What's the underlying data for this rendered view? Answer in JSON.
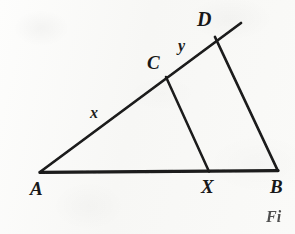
{
  "figure": {
    "caption_fragment": "Fi",
    "background_color": "#fbfbfa",
    "ink_color": "#1a1a1a",
    "vertices": [
      {
        "id": "A",
        "label": "A",
        "x": 40,
        "y": 172,
        "label_x": 30,
        "label_y": 179,
        "font_size": 19
      },
      {
        "id": "B",
        "label": "B",
        "x": 277,
        "y": 170,
        "label_x": 270,
        "label_y": 177,
        "font_size": 19
      },
      {
        "id": "C",
        "label": "C",
        "x": 166,
        "y": 77,
        "label_x": 147,
        "label_y": 53,
        "font_size": 19
      },
      {
        "id": "D",
        "label": "D",
        "x": 215,
        "y": 37,
        "label_x": 197,
        "label_y": 9,
        "font_size": 20
      },
      {
        "id": "X",
        "label": "X",
        "x": 209,
        "y": 171,
        "label_x": 201,
        "label_y": 177,
        "font_size": 19
      }
    ],
    "segment_labels": [
      {
        "id": "x",
        "label": "x",
        "label_x": 90,
        "label_y": 105,
        "font_size": 16,
        "describes": "A to C"
      },
      {
        "id": "y",
        "label": "y",
        "label_x": 178,
        "label_y": 38,
        "font_size": 16,
        "describes": "C to D"
      }
    ],
    "edges": [
      {
        "id": "AB",
        "from": "A",
        "to": "B",
        "x1": 40,
        "y1": 172,
        "x2": 278,
        "y2": 170,
        "width": 3.4
      },
      {
        "id": "AD-ray",
        "from": "A",
        "to": "ray-end",
        "x1": 40,
        "y1": 172,
        "x2": 241,
        "y2": 23,
        "width": 2.7
      },
      {
        "id": "DB",
        "from": "D",
        "to": "B",
        "x1": 215,
        "y1": 37,
        "x2": 277,
        "y2": 170,
        "width": 2.7
      },
      {
        "id": "CX",
        "from": "C",
        "to": "X",
        "x1": 166,
        "y1": 77,
        "x2": 209,
        "y2": 171,
        "width": 2.5
      }
    ],
    "ray_extension": {
      "id": "beyond-D",
      "note": "line AD continues past D toward upper right",
      "x1": 215,
      "y1": 37,
      "x2": 241,
      "y2": 23
    }
  }
}
